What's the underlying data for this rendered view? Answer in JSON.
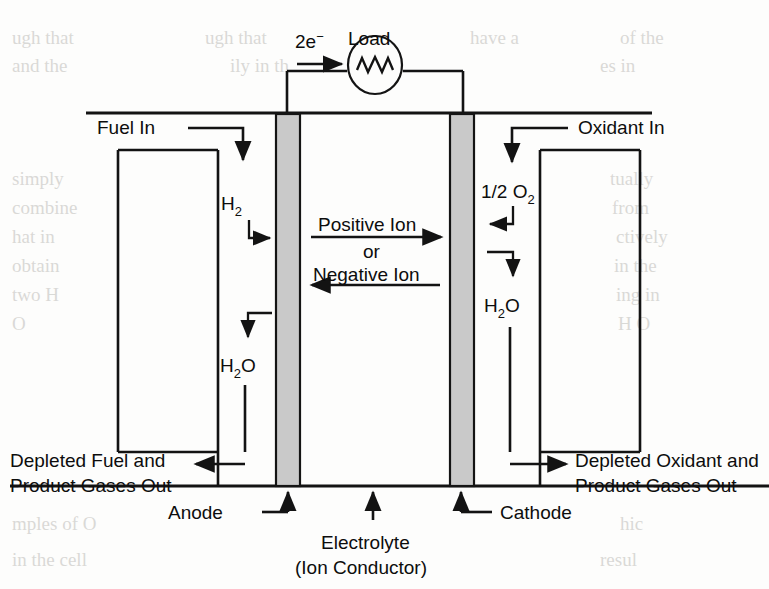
{
  "figure": {
    "type": "schematic-diagram",
    "background_color": "#fdfdfc",
    "line_color": "#131313",
    "electrode_fill": "#c9c9c9"
  },
  "labels": {
    "electron_flow": "2e",
    "electron_flow_sup": "−",
    "load": "Load",
    "fuel_in": "Fuel In",
    "oxidant_in": "Oxidant In",
    "hydrogen": "H",
    "hydrogen_sub": "2",
    "oxygen_half": "1/2 O",
    "oxygen_sub": "2",
    "water_left": "H",
    "water_left_sub": "2",
    "water_left_tail": "O",
    "water_right": "H",
    "water_right_sub": "2",
    "water_right_tail": "O",
    "ion_positive": "Positive Ion",
    "ion_or": "or",
    "ion_negative": "Negative Ion",
    "depleted_fuel_line1": "Depleted Fuel and",
    "depleted_fuel_line2": "Product Gases Out",
    "depleted_oxidant_line1": "Depleted Oxidant and",
    "depleted_oxidant_line2": "Product Gases Out",
    "anode": "Anode",
    "cathode": "Cathode",
    "electrolyte_line1": "Electrolyte",
    "electrolyte_line2": "(Ion Conductor)"
  },
  "components": [
    {
      "name": "anode",
      "label": "Anode",
      "kind": "electrode",
      "side": "left"
    },
    {
      "name": "cathode",
      "label": "Cathode",
      "kind": "electrode",
      "side": "right"
    },
    {
      "name": "electrolyte",
      "label": "Electrolyte (Ion Conductor)",
      "kind": "medium",
      "side": "center"
    },
    {
      "name": "load",
      "label": "Load",
      "kind": "external-circuit",
      "side": "top"
    }
  ],
  "flows": [
    {
      "name": "fuel-in",
      "label": "Fuel In",
      "direction": "down",
      "side": "left"
    },
    {
      "name": "hydrogen-to-anode",
      "label": "H2",
      "direction": "right",
      "side": "left"
    },
    {
      "name": "water-from-anode",
      "label": "H2O",
      "direction": "down",
      "side": "left"
    },
    {
      "name": "depleted-fuel-out",
      "label": "Depleted Fuel and Product Gases Out",
      "direction": "left",
      "side": "left"
    },
    {
      "name": "oxidant-in",
      "label": "Oxidant In",
      "direction": "down",
      "side": "right"
    },
    {
      "name": "oxygen-to-cathode",
      "label": "1/2 O2",
      "direction": "left",
      "side": "right"
    },
    {
      "name": "water-from-cathode",
      "label": "H2O",
      "direction": "down",
      "side": "right"
    },
    {
      "name": "depleted-oxidant-out",
      "label": "Depleted Oxidant and Product Gases Out",
      "direction": "right",
      "side": "right"
    },
    {
      "name": "ion-transport-forward",
      "label": "Positive Ion",
      "direction": "right",
      "side": "center"
    },
    {
      "name": "ion-transport-reverse",
      "label": "Negative Ion",
      "direction": "left",
      "side": "center"
    },
    {
      "name": "electron-flow",
      "label": "2e−",
      "direction": "right",
      "side": "top"
    }
  ],
  "bleed_through": {
    "note": "faint show-through text from reverse page",
    "lines": [
      "ugh that",
      "and the",
      "uatly",
      "rom the",
      "ing in two",
      "H O",
      "mples of O",
      "in th"
    ]
  }
}
